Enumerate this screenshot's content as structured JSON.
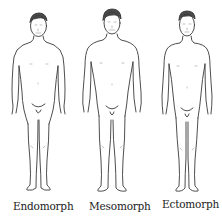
{
  "figures": [
    {
      "id": "endomorph",
      "label": "Endomorph"
    },
    {
      "id": "mesomorph",
      "label": "Mesomorph"
    },
    {
      "id": "ectomorph",
      "label": "Ectomorph"
    }
  ],
  "colors": {
    "line": "#3a3a3a",
    "background": "#ffffff",
    "text": "#222222"
  }
}
